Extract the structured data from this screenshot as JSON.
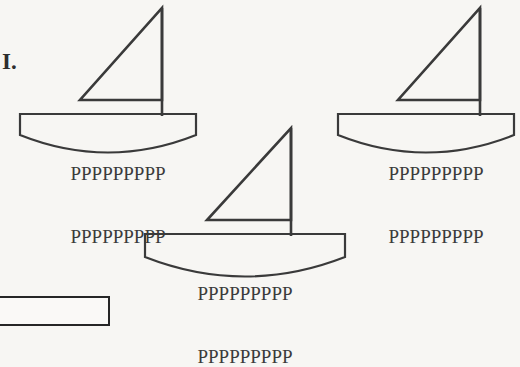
{
  "figure": {
    "label": "I.",
    "background_color": "#f7f6f3",
    "stroke_color": "#3a3a3a",
    "text_color": "#3b3b3b",
    "boats": [
      {
        "id": "boat-left",
        "hull_lines": [
          "PPPPPPPPP",
          "PPPPPPPPP"
        ],
        "sail_shape": "right-triangle",
        "mast": "vertical"
      },
      {
        "id": "boat-right",
        "hull_lines": [
          "PPPPPPPPP",
          "PPPPPPPPP"
        ],
        "sail_shape": "right-triangle",
        "mast": "vertical"
      },
      {
        "id": "boat-bottom",
        "hull_lines": [
          "PPPPPPPPP",
          "PPPPPPPPP"
        ],
        "sail_shape": "right-triangle",
        "mast": "vertical"
      }
    ]
  }
}
